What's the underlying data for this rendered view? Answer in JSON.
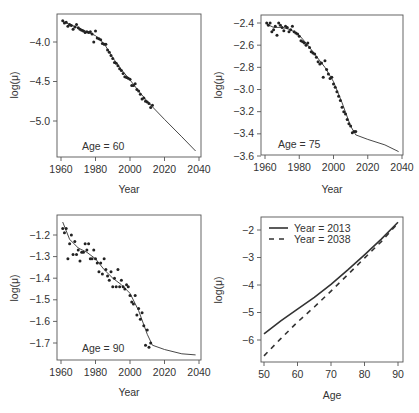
{
  "chart_data": [
    {
      "type": "scatter",
      "panel": "top-left",
      "annotation": "Age = 60",
      "xlabel": "Year",
      "ylabel": "log(μ)",
      "xticks": [
        1960,
        1980,
        2000,
        2020,
        2040
      ],
      "yticks": [
        -4.0,
        -4.5,
        -5.0
      ],
      "ytick_labels": [
        "−4.0",
        "−4.5",
        "−5.0"
      ],
      "xlim": [
        1959,
        2041
      ],
      "ylim": [
        -5.45,
        -3.68
      ],
      "points": {
        "x": [
          1961,
          1962,
          1963,
          1964,
          1965,
          1966,
          1967,
          1968,
          1969,
          1970,
          1971,
          1972,
          1973,
          1974,
          1975,
          1976,
          1977,
          1978,
          1979,
          1980,
          1981,
          1982,
          1983,
          1984,
          1985,
          1986,
          1987,
          1988,
          1989,
          1990,
          1991,
          1992,
          1993,
          1994,
          1995,
          1996,
          1997,
          1998,
          1999,
          2000,
          2001,
          2002,
          2003,
          2004,
          2005,
          2006,
          2007,
          2008,
          2009,
          2010,
          2011,
          2012,
          2013
        ],
        "y": [
          -3.73,
          -3.76,
          -3.75,
          -3.8,
          -3.78,
          -3.79,
          -3.84,
          -3.81,
          -3.78,
          -3.82,
          -3.84,
          -3.85,
          -3.86,
          -3.88,
          -3.87,
          -3.88,
          -3.87,
          -3.9,
          -4.0,
          -3.86,
          -3.95,
          -3.96,
          -3.97,
          -4.02,
          -4.03,
          -4.03,
          -4.1,
          -4.13,
          -4.17,
          -4.21,
          -4.26,
          -4.27,
          -4.3,
          -4.34,
          -4.36,
          -4.4,
          -4.44,
          -4.45,
          -4.46,
          -4.47,
          -4.55,
          -4.55,
          -4.53,
          -4.6,
          -4.62,
          -4.66,
          -4.72,
          -4.71,
          -4.75,
          -4.76,
          -4.78,
          -4.83,
          -4.8
        ]
      },
      "fit_line": {
        "x": [
          1961,
          1970,
          1980,
          1985,
          1990,
          1995,
          2000,
          2005,
          2010,
          2013,
          2020,
          2030,
          2038
        ],
        "y": [
          -3.74,
          -3.82,
          -3.92,
          -4.02,
          -4.2,
          -4.35,
          -4.48,
          -4.62,
          -4.75,
          -4.82,
          -4.98,
          -5.2,
          -5.38
        ]
      }
    },
    {
      "type": "scatter",
      "panel": "top-right",
      "annotation": "Age = 75",
      "xlabel": "Year",
      "ylabel": "log(μ)",
      "xticks": [
        1960,
        1980,
        2000,
        2020,
        2040
      ],
      "yticks": [
        -2.4,
        -2.6,
        -2.8,
        -3.0,
        -3.2,
        -3.4,
        -3.6
      ],
      "ytick_labels": [
        "−2.4",
        "−2.6",
        "−2.8",
        "−3.0",
        "−3.2",
        "−3.4",
        "−3.6"
      ],
      "xlim": [
        1959,
        2041
      ],
      "ylim": [
        -3.6,
        -2.37
      ],
      "points": {
        "x": [
          1961,
          1962,
          1963,
          1964,
          1965,
          1966,
          1967,
          1968,
          1969,
          1970,
          1971,
          1972,
          1973,
          1974,
          1975,
          1976,
          1977,
          1978,
          1979,
          1980,
          1981,
          1982,
          1983,
          1984,
          1985,
          1986,
          1987,
          1988,
          1989,
          1990,
          1991,
          1992,
          1993,
          1994,
          1995,
          1996,
          1997,
          1998,
          1999,
          2000,
          2001,
          2002,
          2003,
          2004,
          2005,
          2006,
          2007,
          2008,
          2009,
          2010,
          2011,
          2012,
          2013
        ],
        "y": [
          -2.4,
          -2.42,
          -2.4,
          -2.48,
          -2.46,
          -2.43,
          -2.51,
          -2.4,
          -2.42,
          -2.44,
          -2.47,
          -2.43,
          -2.44,
          -2.48,
          -2.46,
          -2.43,
          -2.48,
          -2.49,
          -2.5,
          -2.52,
          -2.56,
          -2.57,
          -2.58,
          -2.6,
          -2.58,
          -2.62,
          -2.66,
          -2.67,
          -2.68,
          -2.71,
          -2.75,
          -2.77,
          -2.76,
          -2.89,
          -2.74,
          -2.82,
          -2.86,
          -2.9,
          -2.89,
          -2.95,
          -2.98,
          -3.02,
          -3.06,
          -3.1,
          -3.16,
          -3.2,
          -3.22,
          -3.27,
          -3.31,
          -3.33,
          -3.39,
          -3.38,
          -3.38
        ]
      },
      "fit_line": {
        "x": [
          1961,
          1965,
          1970,
          1975,
          1980,
          1985,
          1990,
          1995,
          2000,
          2005,
          2010,
          2013,
          2020,
          2030,
          2038
        ],
        "y": [
          -2.41,
          -2.44,
          -2.44,
          -2.46,
          -2.51,
          -2.6,
          -2.7,
          -2.8,
          -2.93,
          -3.12,
          -3.33,
          -3.41,
          -3.45,
          -3.5,
          -3.56
        ]
      }
    },
    {
      "type": "scatter",
      "panel": "bottom-left",
      "annotation": "Age = 90",
      "xlabel": "Year",
      "ylabel": "log(μ)",
      "xticks": [
        1960,
        1980,
        2000,
        2020,
        2040
      ],
      "yticks": [
        -1.2,
        -1.3,
        -1.4,
        -1.5,
        -1.6,
        -1.7
      ],
      "ytick_labels": [
        "−1.2",
        "−1.3",
        "−1.4",
        "−1.5",
        "−1.6",
        "−1.7"
      ],
      "xlim": [
        1959,
        2041
      ],
      "ylim": [
        -1.78,
        -1.14
      ],
      "points": {
        "x": [
          1961,
          1962,
          1963,
          1964,
          1965,
          1966,
          1967,
          1968,
          1969,
          1970,
          1971,
          1972,
          1973,
          1974,
          1975,
          1976,
          1977,
          1978,
          1979,
          1980,
          1981,
          1982,
          1983,
          1984,
          1985,
          1986,
          1987,
          1988,
          1989,
          1990,
          1991,
          1992,
          1993,
          1994,
          1995,
          1996,
          1997,
          1998,
          1999,
          2000,
          2001,
          2002,
          2003,
          2004,
          2005,
          2006,
          2007,
          2008,
          2009,
          2010,
          2011,
          2012
        ],
        "y": [
          -1.17,
          -1.19,
          -1.17,
          -1.31,
          -1.24,
          -1.2,
          -1.29,
          -1.23,
          -1.29,
          -1.27,
          -1.32,
          -1.28,
          -1.28,
          -1.24,
          -1.27,
          -1.24,
          -1.31,
          -1.31,
          -1.27,
          -1.31,
          -1.33,
          -1.37,
          -1.33,
          -1.38,
          -1.31,
          -1.36,
          -1.39,
          -1.41,
          -1.37,
          -1.44,
          -1.4,
          -1.44,
          -1.36,
          -1.44,
          -1.41,
          -1.44,
          -1.45,
          -1.43,
          -1.44,
          -1.48,
          -1.51,
          -1.52,
          -1.48,
          -1.57,
          -1.54,
          -1.59,
          -1.56,
          -1.62,
          -1.71,
          -1.64,
          -1.72,
          -1.7
        ]
      },
      "fit_line": {
        "x": [
          1961,
          1965,
          1970,
          1975,
          1980,
          1985,
          1990,
          1995,
          2000,
          2005,
          2010,
          2013,
          2020,
          2030,
          2038
        ],
        "y": [
          -1.14,
          -1.22,
          -1.26,
          -1.28,
          -1.31,
          -1.36,
          -1.4,
          -1.43,
          -1.47,
          -1.55,
          -1.66,
          -1.71,
          -1.73,
          -1.75,
          -1.755
        ]
      }
    },
    {
      "type": "line",
      "panel": "bottom-right",
      "xlabel": "Age",
      "ylabel": "log(μ)",
      "xticks": [
        50,
        60,
        70,
        80,
        90
      ],
      "yticks": [
        -2,
        -3,
        -4,
        -5,
        -6
      ],
      "ytick_labels": [
        "−2",
        "−3",
        "−4",
        "−5",
        "−6"
      ],
      "xlim": [
        49,
        91
      ],
      "ylim": [
        -6.8,
        -1.5
      ],
      "legend": [
        "Year = 2013",
        "Year = 2038"
      ],
      "legend_position": "top-left",
      "series": [
        {
          "name": "Year = 2013",
          "style": "solid",
          "x": [
            50,
            55,
            60,
            65,
            70,
            75,
            80,
            85,
            90
          ],
          "y": [
            -5.78,
            -5.3,
            -4.88,
            -4.45,
            -3.98,
            -3.45,
            -2.9,
            -2.33,
            -1.72
          ]
        },
        {
          "name": "Year = 2038",
          "style": "dashed",
          "x": [
            50,
            55,
            60,
            65,
            70,
            75,
            80,
            85,
            90
          ],
          "y": [
            -6.58,
            -5.95,
            -5.35,
            -4.8,
            -4.22,
            -3.62,
            -3.02,
            -2.42,
            -1.75
          ]
        }
      ]
    }
  ]
}
